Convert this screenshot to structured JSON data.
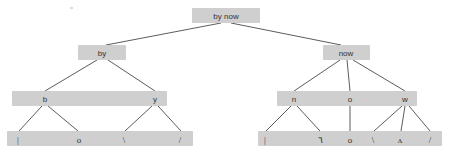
{
  "figure": {
    "background_color": "#ffffff",
    "node_fill_color": "#cfcfcf",
    "edge_color": "#4a4a4a",
    "text_color": "#333333",
    "width": 449,
    "height": 156
  },
  "levels": [
    {
      "name": "root",
      "y": 10
    },
    {
      "name": "word",
      "y": 47
    },
    {
      "name": "letter",
      "y": 93
    },
    {
      "name": "stroke",
      "y": 133
    }
  ],
  "nodes": {
    "root": {
      "label": "by now",
      "x": 226,
      "y": 10,
      "level": 0
    },
    "word_left": {
      "label": "by",
      "x": 102,
      "y": 47,
      "level": 1
    },
    "word_right": {
      "label": "now",
      "x": 346,
      "y": 47,
      "level": 1
    },
    "letter_b": {
      "label": "b",
      "x": 45,
      "y": 93,
      "level": 2
    },
    "letter_y": {
      "label": "y",
      "x": 155,
      "y": 93,
      "level": 2
    },
    "letter_n": {
      "label": "n",
      "x": 294,
      "y": 93,
      "level": 2
    },
    "letter_o": {
      "label": "o",
      "x": 350,
      "y": 93,
      "level": 2
    },
    "letter_w": {
      "label": "w",
      "x": 405,
      "y": 93,
      "level": 2
    },
    "stroke_l1": {
      "label": "|",
      "x": 18,
      "y": 133,
      "level": 3
    },
    "stroke_l2": {
      "label": "o",
      "x": 79,
      "y": 133,
      "level": 3
    },
    "stroke_l3": {
      "label": "\\",
      "x": 124,
      "y": 133,
      "level": 3
    },
    "stroke_l4": {
      "label": "/",
      "x": 180,
      "y": 133,
      "level": 3
    },
    "stroke_r1": {
      "label": "|",
      "x": 265,
      "y": 133,
      "level": 3
    },
    "stroke_r2": {
      "label": "٦",
      "x": 320,
      "y": 133,
      "level": 3
    },
    "stroke_r3": {
      "label": "o",
      "x": 350,
      "y": 133,
      "level": 3
    },
    "stroke_r4": {
      "label": "\\",
      "x": 373,
      "y": 133,
      "level": 3
    },
    "stroke_r5": {
      "label": "ʌ",
      "x": 400,
      "y": 133,
      "level": 3
    },
    "stroke_r6": {
      "label": "/",
      "x": 430,
      "y": 133,
      "level": 3
    }
  },
  "bands": [
    {
      "name": "root-band",
      "x": 192,
      "y": 8,
      "width": 68,
      "height": 15
    },
    {
      "name": "word-left-band",
      "x": 78,
      "y": 45,
      "width": 48,
      "height": 15
    },
    {
      "name": "word-right-band",
      "x": 323,
      "y": 45,
      "width": 47,
      "height": 15
    },
    {
      "name": "letter-left-band",
      "x": 12,
      "y": 91,
      "width": 155,
      "height": 15
    },
    {
      "name": "letter-right-band",
      "x": 277,
      "y": 91,
      "width": 140,
      "height": 15
    },
    {
      "name": "stroke-left-band",
      "x": 7,
      "y": 131,
      "width": 186,
      "height": 15
    },
    {
      "name": "stroke-right-band",
      "x": 258,
      "y": 131,
      "width": 184,
      "height": 15
    }
  ],
  "edges": [
    {
      "name": "root-to-by",
      "from": "root",
      "to": "word_left",
      "x1": 221,
      "y1": 23,
      "x2": 106,
      "y2": 45
    },
    {
      "name": "root-to-now",
      "from": "root",
      "to": "word_right",
      "x1": 231,
      "y1": 23,
      "x2": 341,
      "y2": 45
    },
    {
      "name": "by-to-b",
      "from": "word_left",
      "to": "letter_b",
      "x1": 97,
      "y1": 60,
      "x2": 45,
      "y2": 91
    },
    {
      "name": "by-to-y",
      "from": "word_left",
      "to": "letter_y",
      "x1": 108,
      "y1": 60,
      "x2": 155,
      "y2": 91
    },
    {
      "name": "now-to-n",
      "from": "word_right",
      "to": "letter_n",
      "x1": 340,
      "y1": 60,
      "x2": 294,
      "y2": 91
    },
    {
      "name": "now-to-o",
      "from": "word_right",
      "to": "letter_o",
      "x1": 347,
      "y1": 60,
      "x2": 350,
      "y2": 91
    },
    {
      "name": "now-to-w",
      "from": "word_right",
      "to": "letter_w",
      "x1": 353,
      "y1": 60,
      "x2": 405,
      "y2": 91
    },
    {
      "name": "b-to-stroke1",
      "from": "letter_b",
      "to": "stroke_l1",
      "x1": 42,
      "y1": 106,
      "x2": 19,
      "y2": 131
    },
    {
      "name": "b-to-stroke2",
      "from": "letter_b",
      "to": "stroke_l2",
      "x1": 48,
      "y1": 106,
      "x2": 78,
      "y2": 131
    },
    {
      "name": "y-to-stroke3",
      "from": "letter_y",
      "to": "stroke_l3",
      "x1": 152,
      "y1": 106,
      "x2": 125,
      "y2": 131
    },
    {
      "name": "y-to-stroke4",
      "from": "letter_y",
      "to": "stroke_l4",
      "x1": 158,
      "y1": 106,
      "x2": 181,
      "y2": 131
    },
    {
      "name": "n-to-stroke1",
      "from": "letter_n",
      "to": "stroke_r1",
      "x1": 291,
      "y1": 106,
      "x2": 266,
      "y2": 131
    },
    {
      "name": "n-to-stroke2",
      "from": "letter_n",
      "to": "stroke_r2",
      "x1": 297,
      "y1": 106,
      "x2": 320,
      "y2": 131
    },
    {
      "name": "o-to-stroke3",
      "from": "letter_o",
      "to": "stroke_r3",
      "x1": 350,
      "y1": 106,
      "x2": 350,
      "y2": 131
    },
    {
      "name": "w-to-stroke4",
      "from": "letter_w",
      "to": "stroke_r4",
      "x1": 402,
      "y1": 106,
      "x2": 374,
      "y2": 131
    },
    {
      "name": "w-to-stroke5",
      "from": "letter_w",
      "to": "stroke_r5",
      "x1": 405,
      "y1": 106,
      "x2": 401,
      "y2": 131
    },
    {
      "name": "w-to-stroke6",
      "from": "letter_w",
      "to": "stroke_r6",
      "x1": 409,
      "y1": 106,
      "x2": 430,
      "y2": 131
    }
  ],
  "specks": [
    {
      "name": "speck-top",
      "x": 70,
      "y": 7,
      "width": 3,
      "height": 2
    }
  ]
}
